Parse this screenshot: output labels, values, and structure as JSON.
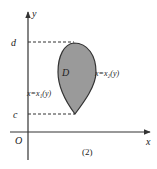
{
  "diagram": {
    "axes": {
      "x_label": "x",
      "y_label": "y",
      "origin_label": "O"
    },
    "levels": {
      "top": "d",
      "bottom": "c"
    },
    "region_label": "D",
    "left_curve_label": "x=x₁(y)",
    "right_curve_label": "x=x₂(y)",
    "caption": "(2)",
    "colors": {
      "region_fill": "#9a9a9a",
      "stroke": "#333333"
    }
  }
}
